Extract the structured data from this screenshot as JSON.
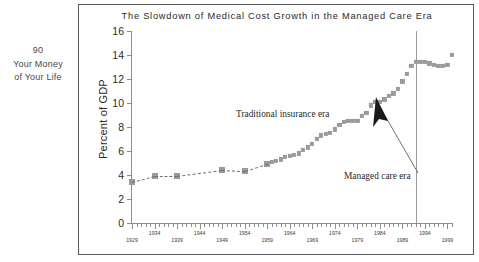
{
  "page_margin": {
    "folio": "90",
    "line1": "Your Money",
    "line2": "of Your Life"
  },
  "chart_data": {
    "type": "line",
    "title": "The Slowdown of Medical Cost Growth in the Managed Care Era",
    "subtitle": "",
    "xlabel": "",
    "ylabel": "Percent of GDP",
    "xlim": [
      1929,
      2000
    ],
    "ylim": [
      0,
      16
    ],
    "grid": false,
    "legend_position": "none",
    "y_ticks": [
      0,
      2,
      4,
      6,
      8,
      10,
      12,
      14,
      16
    ],
    "y_tick_labels": [
      "0",
      "2",
      "4",
      "6",
      "8",
      "10",
      "12",
      "14",
      "16"
    ],
    "x_tick_labels_upper": [
      "1934",
      "1944",
      "1954",
      "1964",
      "1974",
      "1984",
      "1994"
    ],
    "x_tick_labels_lower": [
      "1929",
      "1939",
      "1949",
      "1959",
      "1969",
      "1979",
      "1989",
      "1999"
    ],
    "x_tick_interval_minor": 1,
    "x_tick_interval_major": 5,
    "series": [
      {
        "name": "Health spending as percent of GDP",
        "marker": "square",
        "marker_color": "#9a9a9a",
        "line_style_sparse": "dashed",
        "x": [
          1929,
          1934,
          1939,
          1949,
          1954,
          1959,
          1960,
          1961,
          1962,
          1963,
          1964,
          1965,
          1966,
          1967,
          1968,
          1969,
          1970,
          1971,
          1972,
          1973,
          1974,
          1975,
          1976,
          1977,
          1978,
          1979,
          1980,
          1981,
          1982,
          1983,
          1984,
          1985,
          1986,
          1987,
          1988,
          1989,
          1990,
          1991,
          1992,
          1993,
          1994,
          1995,
          1996,
          1997,
          1998,
          1999,
          2000
        ],
        "values": [
          3.4,
          3.9,
          3.9,
          4.4,
          4.3,
          4.9,
          5.1,
          5.2,
          5.3,
          5.5,
          5.6,
          5.7,
          5.8,
          6.1,
          6.3,
          6.6,
          7.0,
          7.3,
          7.4,
          7.5,
          7.8,
          8.2,
          8.4,
          8.5,
          8.5,
          8.5,
          8.9,
          9.2,
          9.8,
          10.1,
          10.1,
          10.3,
          10.6,
          10.8,
          11.2,
          11.8,
          12.4,
          13.1,
          13.4,
          13.4,
          13.4,
          13.3,
          13.2,
          13.1,
          13.1,
          13.2,
          14.0
        ]
      }
    ],
    "annotations": [
      {
        "name": "traditional-insurance-era",
        "text": "Traditional insurance era",
        "x": 1963,
        "y": 10.3
      },
      {
        "name": "managed-care-era",
        "text": "Managed care era",
        "x": 1983,
        "y": 5.0
      }
    ],
    "reference_line": {
      "name": "managed-care-divider",
      "x": 1992,
      "y_top": 16,
      "y_bottom": 0,
      "color": "#9a9a9a"
    },
    "arrow": {
      "name": "managed-care-arrow",
      "from_x": 1987,
      "from_y": 5.7,
      "to_x": 1992.5,
      "to_y": 12.2,
      "color": "#1a1a1a"
    }
  },
  "colors": {
    "marker": "#9a9a9a",
    "axis": "#8e8e8e",
    "frame": "#5a5a5a",
    "text": "#2b2b2b",
    "arrow": "#1a1a1a"
  }
}
